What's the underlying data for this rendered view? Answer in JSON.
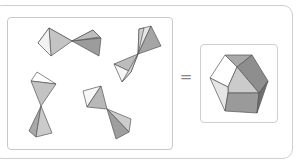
{
  "diagram": {
    "operator": "=",
    "left_group": {
      "description": "Four pairs of tetrahedra joined at a vertex",
      "pairs": 4
    },
    "right_group": {
      "description": "Hexagonal solid (rhombic dodecahedron view)"
    },
    "colors": {
      "light_face": "#ffffff",
      "mid_face": "#c8c8c8",
      "dark_face": "#9a9a9a",
      "darker_face": "#7d7d7d",
      "edge": "#555555",
      "frame": "#cccccc"
    }
  }
}
